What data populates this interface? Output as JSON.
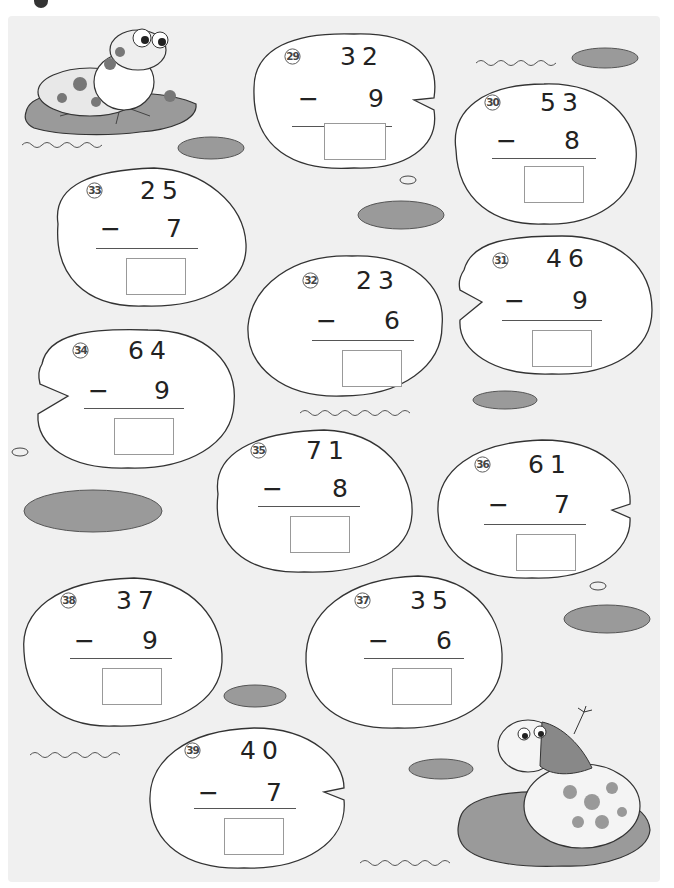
{
  "worksheet": {
    "problems": [
      {
        "id": "29",
        "label": "㉙",
        "minuend": "32",
        "subtrahend": "9",
        "operator": "−",
        "answer": ""
      },
      {
        "id": "30",
        "label": "㉚",
        "minuend": "53",
        "subtrahend": "8",
        "operator": "−",
        "answer": ""
      },
      {
        "id": "31",
        "label": "㉛",
        "minuend": "46",
        "subtrahend": "9",
        "operator": "−",
        "answer": ""
      },
      {
        "id": "32",
        "label": "㉜",
        "minuend": "23",
        "subtrahend": "6",
        "operator": "−",
        "answer": ""
      },
      {
        "id": "33",
        "label": "㉝",
        "minuend": "25",
        "subtrahend": "7",
        "operator": "−",
        "answer": ""
      },
      {
        "id": "34",
        "label": "㉞",
        "minuend": "64",
        "subtrahend": "9",
        "operator": "−",
        "answer": ""
      },
      {
        "id": "35",
        "label": "㉟",
        "minuend": "71",
        "subtrahend": "8",
        "operator": "−",
        "answer": ""
      },
      {
        "id": "36",
        "label": "㊱",
        "minuend": "61",
        "subtrahend": "7",
        "operator": "−",
        "answer": ""
      },
      {
        "id": "37",
        "label": "㊲",
        "minuend": "35",
        "subtrahend": "6",
        "operator": "−",
        "answer": ""
      },
      {
        "id": "38",
        "label": "㊳",
        "minuend": "37",
        "subtrahend": "9",
        "operator": "−",
        "answer": ""
      },
      {
        "id": "39",
        "label": "㊴",
        "minuend": "40",
        "subtrahend": "7",
        "operator": "−",
        "answer": ""
      }
    ]
  },
  "illustrations": {
    "frog_top_left": "frog-on-lily-pad",
    "frog_bottom_right": "frog-with-headscarf-on-lily-pad"
  },
  "colors": {
    "background": "#f0f0f0",
    "pad_fill": "#ffffff",
    "lily_pad": "#9a9a9a",
    "outline": "#333333",
    "answer_box": "#999999"
  }
}
